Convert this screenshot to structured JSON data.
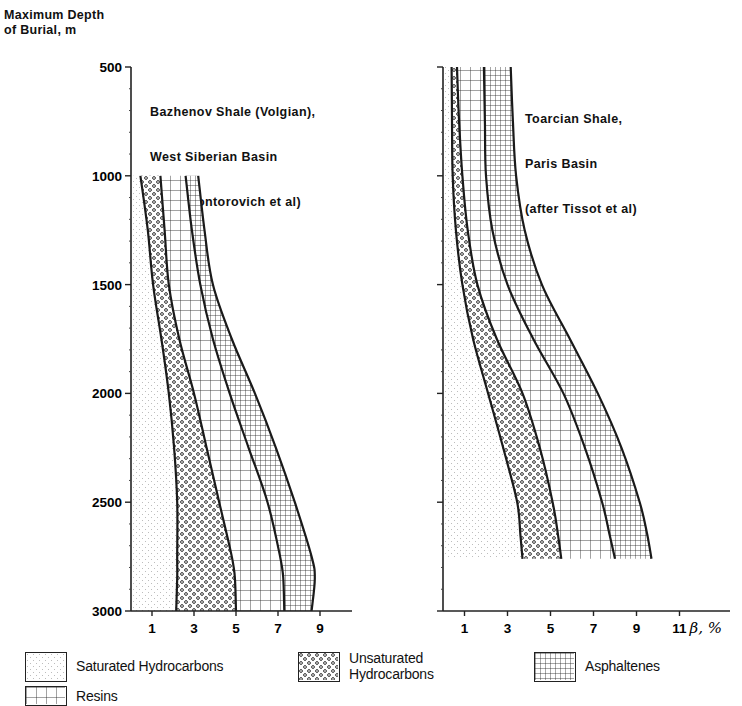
{
  "y_axis_label": [
    "Maximum Depth",
    "of Burial, m"
  ],
  "x_axis_unit_label": "β, %",
  "chart_data": [
    {
      "type": "area",
      "title": "Bazhenov Shale (Volgian), West Siberian Basin (after Kontorovich et al)",
      "title_lines": [
        "Bazhenov Shale (Volgian),",
        "West Siberian Basin",
        "(after Kontorovich et al)"
      ],
      "xlabel": "β, %",
      "ylabel": "Maximum Depth of Burial, m",
      "ylim": [
        500,
        3000
      ],
      "y_inverted": true,
      "y_ticks": [
        500,
        1000,
        1500,
        2000,
        2500,
        3000
      ],
      "y_tick_labels_shown": true,
      "xlim": [
        0,
        10.5
      ],
      "x_ticks": [
        1,
        3,
        5,
        7,
        9
      ],
      "grid": false,
      "stacked": true,
      "depth": [
        1000,
        1250,
        1500,
        1750,
        2000,
        2250,
        2500,
        2750,
        2850,
        3000
      ],
      "cumulative_boundaries": [
        {
          "name": "Saturated Hydrocarbons",
          "values": [
            0.45,
            0.8,
            1.05,
            1.45,
            1.8,
            2.05,
            2.2,
            2.2,
            2.2,
            2.15
          ]
        },
        {
          "name": "Unsaturated Hydrocarbons",
          "values": [
            1.4,
            1.6,
            1.8,
            2.3,
            3.0,
            3.6,
            4.2,
            4.8,
            4.95,
            5.0
          ]
        },
        {
          "name": "Resins",
          "values": [
            2.6,
            2.9,
            3.3,
            3.9,
            4.7,
            5.6,
            6.5,
            7.1,
            7.25,
            7.3
          ]
        },
        {
          "name": "Asphaltenes",
          "values": [
            3.2,
            3.5,
            3.9,
            4.8,
            5.9,
            6.9,
            7.8,
            8.6,
            8.75,
            8.6
          ]
        }
      ]
    },
    {
      "type": "area",
      "title": "Toarcian Shale, Paris Basin (after Tissot et al)",
      "title_lines": [
        "Toarcian Shale,",
        "Paris Basin",
        "(after Tissot et al)"
      ],
      "xlabel": "β, %",
      "ylabel": "Maximum Depth of Burial, m",
      "ylim": [
        500,
        3000
      ],
      "y_inverted": true,
      "y_ticks": [
        500,
        1000,
        1500,
        2000,
        2500,
        3000
      ],
      "y_tick_labels_shown": false,
      "xlim": [
        0,
        11.3
      ],
      "x_ticks": [
        1,
        3,
        5,
        7,
        9,
        11
      ],
      "grid": false,
      "stacked": true,
      "depth": [
        500,
        750,
        1000,
        1250,
        1500,
        1750,
        2000,
        2250,
        2500,
        2650,
        2760
      ],
      "cumulative_boundaries": [
        {
          "name": "Saturated Hydrocarbons",
          "values": [
            0.4,
            0.42,
            0.45,
            0.6,
            0.9,
            1.4,
            2.1,
            2.8,
            3.45,
            3.6,
            3.7
          ]
        },
        {
          "name": "Unsaturated Hydrocarbons",
          "values": [
            0.65,
            0.75,
            0.9,
            1.15,
            1.6,
            2.5,
            3.7,
            4.5,
            5.1,
            5.35,
            5.5
          ]
        },
        {
          "name": "Resins",
          "values": [
            1.9,
            1.95,
            2.0,
            2.3,
            3.0,
            4.2,
            5.6,
            6.6,
            7.4,
            7.75,
            8.0
          ]
        },
        {
          "name": "Asphaltenes",
          "values": [
            3.15,
            3.25,
            3.4,
            3.8,
            4.6,
            5.9,
            7.2,
            8.3,
            9.15,
            9.5,
            9.7
          ]
        }
      ]
    }
  ],
  "legend": [
    {
      "key": "saturated",
      "label": "Saturated Hydrocarbons",
      "pattern": "fine-dots"
    },
    {
      "key": "unsaturated",
      "label_lines": [
        "Unsaturated",
        "Hydrocarbons"
      ],
      "label": "Unsaturated Hydrocarbons",
      "pattern": "coarse-dots"
    },
    {
      "key": "asphaltenes",
      "label": "Asphaltenes",
      "pattern": "fine-grid"
    },
    {
      "key": "resins",
      "label": "Resins",
      "pattern": "coarse-grid"
    }
  ]
}
